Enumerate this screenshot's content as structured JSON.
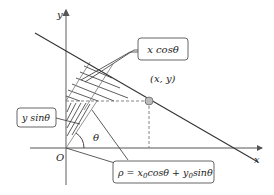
{
  "diagram": {
    "axes": {
      "x_label": "x",
      "y_label": "y",
      "origin_label": "O"
    },
    "angle_label": "θ",
    "point_label": "(x, y)",
    "callouts": {
      "x_cos": "x cosθ",
      "y_sin": "y sinθ",
      "rho_eq_rho": "ρ = ",
      "rho_eq_x0": "x",
      "rho_eq_sub0a": "0",
      "rho_eq_cos": "cosθ + ",
      "rho_eq_y0": "y",
      "rho_eq_sub0b": "0",
      "rho_eq_sin": "sinθ"
    },
    "colors": {
      "line": "#333333",
      "axis": "#555555",
      "dashed": "#777777",
      "point_fill": "#bbbbbb"
    }
  }
}
